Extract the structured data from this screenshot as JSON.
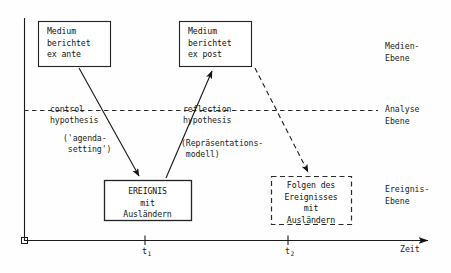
{
  "diagram": {
    "type": "timeline-flow-diagram",
    "language": "de",
    "boxes": [
      {
        "id": "medium-ex-ante",
        "lines": [
          "Medium",
          "berichtet",
          "ex ante"
        ],
        "border": "solid",
        "align": "left",
        "x": 38,
        "y": 21,
        "w": 72,
        "h": 45
      },
      {
        "id": "medium-ex-post",
        "lines": [
          "Medium",
          "berichtet",
          "ex post"
        ],
        "border": "solid",
        "align": "left",
        "x": 179,
        "y": 21,
        "w": 72,
        "h": 45
      },
      {
        "id": "ereignis",
        "lines": [
          "EREIGNIS",
          "mit",
          "Ausländern"
        ],
        "border": "solid",
        "align": "center",
        "x": 104,
        "y": 180,
        "w": 87,
        "h": 40
      },
      {
        "id": "folgen",
        "lines": [
          "Folgen des",
          "Ereignisses",
          "mit",
          "Ausländern"
        ],
        "border": "dashed",
        "align": "center",
        "x": 271,
        "y": 176,
        "w": 80,
        "h": 48
      }
    ],
    "annotations": [
      {
        "id": "control-hypothesis",
        "lines": [
          "control",
          "hypothesis"
        ],
        "x": 50,
        "y": 104
      },
      {
        "id": "agenda-setting",
        "lines": [
          "('agenda-",
          " setting')"
        ],
        "x": 63,
        "y": 133
      },
      {
        "id": "reflection-hypothesis",
        "lines": [
          "reflection",
          "hypothesis"
        ],
        "x": 183,
        "y": 104
      },
      {
        "id": "repraesentationsmodell",
        "lines": [
          "(Repräsentations-",
          " modell)"
        ],
        "x": 181,
        "y": 138
      }
    ],
    "level_labels": [
      {
        "id": "medien-ebene",
        "lines": [
          "Medien-",
          "Ebene"
        ],
        "x": 385,
        "y": 41
      },
      {
        "id": "analyse-ebene",
        "lines": [
          "Analyse",
          "Ebene"
        ],
        "x": 385,
        "y": 104
      },
      {
        "id": "ereignis-ebene",
        "lines": [
          "Ereignis-",
          "Ebene"
        ],
        "x": 385,
        "y": 184
      }
    ],
    "axis": {
      "time_label": "Zeit",
      "time_label_x": 400,
      "time_label_y": 245,
      "ticks": [
        {
          "id": "t1",
          "label": "t",
          "sub": "1",
          "x": 142,
          "y": 243
        },
        {
          "id": "t2",
          "label": "t",
          "sub": "2",
          "x": 285,
          "y": 243
        }
      ]
    },
    "colors": {
      "ink": "#1b1b1b",
      "background": "#fefefe",
      "box_border": "#222222",
      "dashed_border": "#2a2a2a"
    }
  }
}
